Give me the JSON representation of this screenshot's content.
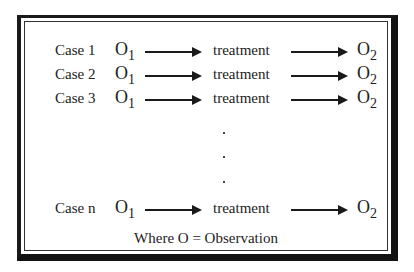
{
  "diagram": {
    "rows": [
      {
        "case": "Case 1",
        "pre": "O",
        "pre_sub": "1",
        "middle": "treatment",
        "post": "O",
        "post_sub": "2"
      },
      {
        "case": "Case 2",
        "pre": "O",
        "pre_sub": "1",
        "middle": "treatment",
        "post": "O",
        "post_sub": "2"
      },
      {
        "case": "Case 3",
        "pre": "O",
        "pre_sub": "1",
        "middle": "treatment",
        "post": "O",
        "post_sub": "2"
      },
      {
        "case": "Case n",
        "pre": "O",
        "pre_sub": "1",
        "middle": "treatment",
        "post": "O",
        "post_sub": "2"
      }
    ],
    "ellipsis": [
      ".",
      ".",
      "."
    ],
    "footnote": "Where O = Observation"
  }
}
